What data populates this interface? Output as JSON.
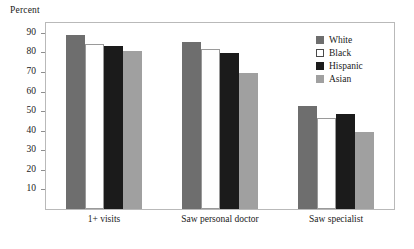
{
  "chart_data": {
    "type": "bar",
    "title": "",
    "subtitle": "",
    "xlabel": "",
    "ylabel": "Percent",
    "ylim": [
      0,
      95
    ],
    "yticks": [
      10,
      20,
      30,
      40,
      50,
      60,
      70,
      80,
      90
    ],
    "ytick_labels": [
      "10",
      "20",
      "30",
      "40",
      "50",
      "60",
      "70",
      "80",
      "90"
    ],
    "grid": false,
    "legend_position": "top-right",
    "categories": [
      "1+ visits",
      "Saw personal doctor",
      "Saw specialist"
    ],
    "series": [
      {
        "name": "White",
        "color": "#6e6e6e",
        "values": [
          89.0,
          85.5,
          52.5
        ]
      },
      {
        "name": "Black",
        "color": "#ffffff",
        "values": [
          84.5,
          81.5,
          46.5
        ]
      },
      {
        "name": "Hispanic",
        "color": "#1b1b1b",
        "values": [
          83.5,
          79.5,
          48.5
        ]
      },
      {
        "name": "Asian",
        "color": "#a0a0a0",
        "values": [
          80.5,
          69.5,
          39.5
        ]
      }
    ]
  },
  "legend": {
    "items": [
      {
        "label": "White",
        "swatch": "legend-swatch-white"
      },
      {
        "label": "Black",
        "swatch": "legend-swatch-black"
      },
      {
        "label": "Hispanic",
        "swatch": "legend-swatch-hispanic"
      },
      {
        "label": "Asian",
        "swatch": "legend-swatch-asian"
      }
    ]
  },
  "colors": {
    "series_white": "#6e6e6e",
    "series_black": "#ffffff",
    "series_hispanic": "#1b1b1b",
    "series_asian": "#a0a0a0",
    "frame": "#b9b9b9",
    "tick": "#8e8e8e",
    "text": "#1a1a1a",
    "background": "#ffffff"
  }
}
